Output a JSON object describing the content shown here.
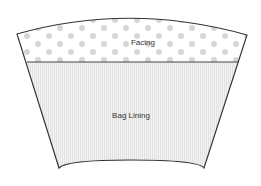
{
  "diagram": {
    "sections": [
      {
        "label": "Facing",
        "pattern": "dots",
        "dot_color": "#d6d6d6"
      },
      {
        "label": "Bag Lining",
        "pattern": "vertical-stripes",
        "fill_color": "#ececec"
      }
    ],
    "outline_color": "#333333"
  }
}
